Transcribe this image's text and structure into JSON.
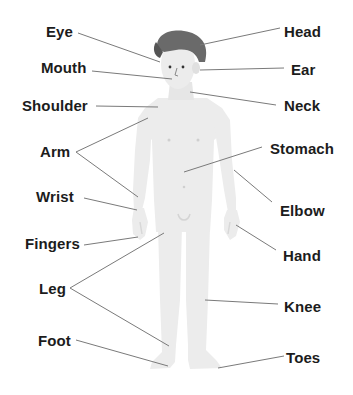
{
  "diagram": {
    "colors": {
      "skin": "#ececec",
      "skin_shade": "#dedede",
      "hair": "#6a6a6a",
      "hair_dark": "#555555",
      "line": "#7a7a7a",
      "text": "#1c1c1c",
      "background": "#ffffff"
    },
    "labels_left": [
      {
        "id": "eye",
        "text": "Eye"
      },
      {
        "id": "mouth",
        "text": "Mouth"
      },
      {
        "id": "shoulder",
        "text": "Shoulder"
      },
      {
        "id": "arm",
        "text": "Arm"
      },
      {
        "id": "wrist",
        "text": "Wrist"
      },
      {
        "id": "fingers",
        "text": "Fingers"
      },
      {
        "id": "leg",
        "text": "Leg"
      },
      {
        "id": "foot",
        "text": "Foot"
      }
    ],
    "labels_right": [
      {
        "id": "head",
        "text": "Head"
      },
      {
        "id": "ear",
        "text": "Ear"
      },
      {
        "id": "neck",
        "text": "Neck"
      },
      {
        "id": "stomach",
        "text": "Stomach"
      },
      {
        "id": "elbow",
        "text": "Elbow"
      },
      {
        "id": "hand",
        "text": "Hand"
      },
      {
        "id": "knee",
        "text": "Knee"
      },
      {
        "id": "toes",
        "text": "Toes"
      }
    ]
  }
}
